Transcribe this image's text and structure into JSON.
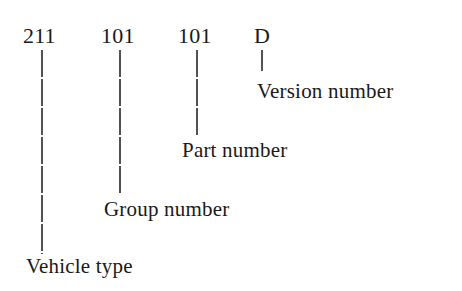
{
  "diagram": {
    "type": "part-number-breakdown",
    "segments": [
      {
        "code": "211",
        "label": "Vehicle type"
      },
      {
        "code": "101",
        "label": "Group number"
      },
      {
        "code": "101",
        "label": "Part number"
      },
      {
        "code": "D",
        "label": "Version number"
      }
    ]
  }
}
